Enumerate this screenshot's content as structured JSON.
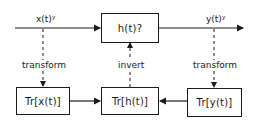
{
  "diagram": {
    "signals": {
      "input": "x(t)ʸ",
      "output": "y(t)ʸ"
    },
    "blocks": {
      "system": "h(t)?",
      "tr_x": "Tr[x(t)]",
      "tr_h": "Tr[h(t)]",
      "tr_y": "Tr[y(t)]"
    },
    "edge_labels": {
      "left": "transform",
      "middle": "invert",
      "right": "transform"
    },
    "colors": {
      "line": "#1a1a1a",
      "background": "#ffffff"
    }
  }
}
